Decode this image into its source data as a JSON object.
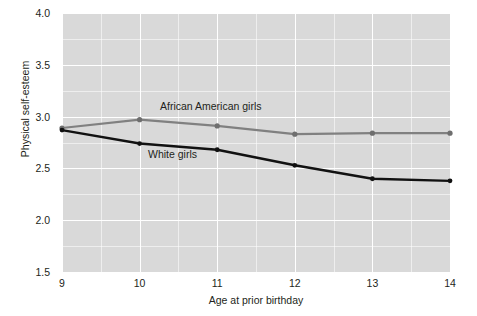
{
  "chart_data": {
    "type": "line",
    "title": "",
    "xlabel": "Age at prior birthday",
    "ylabel": "Physical self-esteem",
    "x": [
      9,
      10,
      11,
      12,
      13,
      14
    ],
    "categories": [
      "9",
      "10",
      "11",
      "12",
      "13",
      "14"
    ],
    "xlim": [
      9,
      14
    ],
    "ylim": [
      1.5,
      4.0
    ],
    "yticks": [
      "4.0",
      "3.5",
      "3.0",
      "2.5",
      "2.0",
      "1.5"
    ],
    "ytick_values": [
      4.0,
      3.5,
      3.0,
      2.5,
      2.0,
      1.5
    ],
    "grid": "major and minor white gridlines on gray panel",
    "legend": "inline annotations next to each line",
    "series": [
      {
        "name": "African American girls",
        "color": "#808080",
        "values": [
          2.89,
          2.97,
          2.91,
          2.83,
          2.84,
          2.84
        ]
      },
      {
        "name": "White girls",
        "color": "#111111",
        "values": [
          2.87,
          2.74,
          2.68,
          2.53,
          2.4,
          2.38
        ]
      }
    ],
    "annotations": [
      {
        "text": "African American girls",
        "series": "African American girls"
      },
      {
        "text": "White girls",
        "series": "White girls"
      }
    ],
    "panel_background": "#d9d9d9",
    "gridline_color": "#ffffff"
  }
}
